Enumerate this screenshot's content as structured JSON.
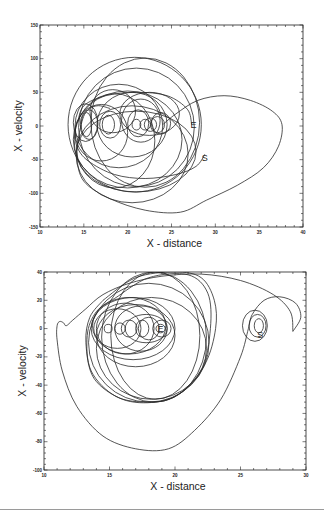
{
  "page": {
    "cropped_caption_fragment": "…a typical trajectory …"
  },
  "chart_data": [
    {
      "type": "line",
      "subtype": "phase-space trajectory",
      "title": "",
      "xlabel": "X - distance",
      "ylabel": "X - velocity",
      "xlim": [
        10,
        40
      ],
      "ylim": [
        -150,
        150
      ],
      "xticks": [
        10,
        15,
        20,
        25,
        30,
        35,
        40
      ],
      "yticks": [
        -150,
        -100,
        -50,
        0,
        50,
        100,
        150
      ],
      "xtick_labels": [
        "10",
        "15",
        "20",
        "25",
        "30",
        "35",
        "40"
      ],
      "ytick_labels": [
        "-150",
        "-100",
        "-50",
        "0",
        "50",
        "100",
        "150"
      ],
      "grid": false,
      "legend": null,
      "frame_px": {
        "x0": 40,
        "y0": 25,
        "x1": 303,
        "y1": 227
      },
      "annotations": [
        {
          "text": "E",
          "x": 27.5,
          "y": 2
        },
        {
          "text": "S",
          "x": 28.8,
          "y": -47
        }
      ],
      "loops": [
        {
          "cx": 15.3,
          "cy": 2,
          "rx": 0.6,
          "ry": 18
        },
        {
          "cx": 15.6,
          "cy": 2,
          "rx": 1.0,
          "ry": 22
        },
        {
          "cx": 15.2,
          "cy": 5,
          "rx": 1.4,
          "ry": 28
        },
        {
          "cx": 17.8,
          "cy": 2,
          "rx": 0.7,
          "ry": 14
        },
        {
          "cx": 18.0,
          "cy": 2,
          "rx": 1.2,
          "ry": 20
        },
        {
          "cx": 18.3,
          "cy": 22,
          "rx": 2.6,
          "ry": 32
        },
        {
          "cx": 21.0,
          "cy": 2,
          "rx": 0.5,
          "ry": 8
        },
        {
          "cx": 21.2,
          "cy": 4,
          "rx": 1.2,
          "ry": 20
        },
        {
          "cx": 21.5,
          "cy": 8,
          "rx": 2.2,
          "ry": 32
        },
        {
          "cx": 22.0,
          "cy": 2,
          "rx": 0.6,
          "ry": 8
        },
        {
          "cx": 22.6,
          "cy": 2,
          "rx": 0.7,
          "ry": 10
        },
        {
          "cx": 23.4,
          "cy": 2,
          "rx": 0.8,
          "ry": 12
        },
        {
          "cx": 23.8,
          "cy": 4,
          "rx": 1.1,
          "ry": 16
        },
        {
          "cx": 22.5,
          "cy": 18,
          "rx": 3.4,
          "ry": 32
        },
        {
          "cx": 20.5,
          "cy": 2,
          "rx": 4.0,
          "ry": 48
        },
        {
          "cx": 19.0,
          "cy": 0,
          "rx": 5.0,
          "ry": 62
        },
        {
          "cx": 21.0,
          "cy": -2,
          "rx": 6.6,
          "ry": 88
        },
        {
          "cx": 22.0,
          "cy": 5,
          "rx": 6.2,
          "ry": 96
        },
        {
          "cx": 20.8,
          "cy": 2,
          "rx": 7.6,
          "ry": 100
        },
        {
          "cx": 17.0,
          "cy": -10,
          "rx": 3.0,
          "ry": 42
        },
        {
          "cx": 18.5,
          "cy": -22,
          "rx": 4.6,
          "ry": 70
        },
        {
          "cx": 20.0,
          "cy": -20,
          "rx": 6.2,
          "ry": 72
        },
        {
          "cx": 20.5,
          "cy": -42,
          "rx": 6.4,
          "ry": 72
        },
        {
          "cx": 21.0,
          "cy": -38,
          "rx": 6.8,
          "ry": 60
        }
      ],
      "curves": [
        {
          "name": "escape-lobe",
          "points": [
            [
              24.0,
              2
            ],
            [
              25.5,
              18
            ],
            [
              28,
              38
            ],
            [
              31,
              45
            ],
            [
              34,
              38
            ],
            [
              36.5,
              22
            ],
            [
              37.6,
              2
            ],
            [
              37.2,
              -30
            ],
            [
              35.5,
              -62
            ],
            [
              32.5,
              -88
            ],
            [
              29,
              -110
            ],
            [
              26,
              -128
            ],
            [
              22,
              -125
            ],
            [
              18,
              -108
            ],
            [
              15,
              -82
            ],
            [
              14.2,
              -45
            ],
            [
              14.5,
              -10
            ],
            [
              15.2,
              20
            ],
            [
              16.5,
              30
            ],
            [
              18,
              26
            ]
          ]
        },
        {
          "name": "start-tail",
          "points": [
            [
              28.8,
              -42
            ],
            [
              27.8,
              -60
            ],
            [
              25.5,
              -72
            ],
            [
              22,
              -78
            ],
            [
              18.5,
              -72
            ],
            [
              15.5,
              -52
            ],
            [
              14.2,
              -30
            ],
            [
              14.0,
              -5
            ]
          ]
        },
        {
          "name": "arc-mid",
          "points": [
            [
              14.3,
              5
            ],
            [
              15.0,
              30
            ],
            [
              17.5,
              45
            ],
            [
              21,
              50
            ],
            [
              24.5,
              45
            ],
            [
              26.8,
              25
            ],
            [
              27.3,
              2
            ]
          ]
        }
      ]
    },
    {
      "type": "line",
      "subtype": "phase-space trajectory",
      "title": "",
      "xlabel": "X - distance",
      "ylabel": "X - velocity",
      "xlim": [
        10,
        30
      ],
      "ylim": [
        -100,
        40
      ],
      "xticks": [
        10,
        15,
        20,
        25,
        30
      ],
      "yticks": [
        -100,
        -80,
        -60,
        -40,
        -20,
        0,
        20,
        40
      ],
      "xtick_labels": [
        "10",
        "15",
        "20",
        "25",
        "30"
      ],
      "ytick_labels": [
        "-100",
        "-80",
        "-60",
        "-40",
        "-20",
        "0",
        "20",
        "40"
      ],
      "grid": false,
      "legend": null,
      "frame_px": {
        "x0": 44,
        "y0": 272,
        "x1": 306,
        "y1": 470
      },
      "annotations": [
        {
          "text": "E",
          "x": 18.9,
          "y": 0
        },
        {
          "text": "S",
          "x": 26.5,
          "y": -4
        }
      ],
      "loops": [
        {
          "cx": 14.9,
          "cy": 0,
          "rx": 0.3,
          "ry": 3
        },
        {
          "cx": 15.8,
          "cy": 0,
          "rx": 0.4,
          "ry": 4
        },
        {
          "cx": 16.5,
          "cy": 0,
          "rx": 0.6,
          "ry": 6
        },
        {
          "cx": 17.5,
          "cy": 0,
          "rx": 0.5,
          "ry": 6
        },
        {
          "cx": 18.0,
          "cy": 0,
          "rx": 0.8,
          "ry": 8
        },
        {
          "cx": 18.9,
          "cy": 0,
          "rx": 0.35,
          "ry": 3
        },
        {
          "cx": 19.0,
          "cy": 0,
          "rx": 0.7,
          "ry": 6
        },
        {
          "cx": 15.6,
          "cy": 0,
          "rx": 1.8,
          "ry": 14
        },
        {
          "cx": 16.2,
          "cy": 0,
          "rx": 2.2,
          "ry": 18
        },
        {
          "cx": 17.4,
          "cy": 0,
          "rx": 2.0,
          "ry": 16
        },
        {
          "cx": 17.8,
          "cy": 0,
          "rx": 1.6,
          "ry": 10
        },
        {
          "cx": 16.5,
          "cy": 2,
          "rx": 2.8,
          "ry": 20
        },
        {
          "cx": 16.8,
          "cy": 0,
          "rx": 3.2,
          "ry": 22
        },
        {
          "cx": 17.0,
          "cy": -5,
          "rx": 3.0,
          "ry": 22
        },
        {
          "cx": 18.2,
          "cy": -14,
          "rx": 4.2,
          "ry": 36
        },
        {
          "cx": 18.0,
          "cy": -10,
          "rx": 4.6,
          "ry": 42
        },
        {
          "cx": 18.4,
          "cy": -6,
          "rx": 4.0,
          "ry": 46
        },
        {
          "cx": 18.5,
          "cy": -5,
          "rx": 3.4,
          "ry": 45
        },
        {
          "cx": 26.4,
          "cy": 2,
          "rx": 0.35,
          "ry": 5
        },
        {
          "cx": 26.3,
          "cy": 2,
          "rx": 0.65,
          "ry": 8
        },
        {
          "cx": 26.1,
          "cy": 2,
          "rx": 0.95,
          "ry": 11
        }
      ],
      "curves": [
        {
          "name": "outer-spiral",
          "points": [
            [
              29.0,
              -2
            ],
            [
              29.6,
              8
            ],
            [
              29.2,
              18
            ],
            [
              28.0,
              22.5
            ],
            [
              26.8,
              20
            ],
            [
              25.9,
              10
            ],
            [
              25.6,
              0
            ],
            [
              25.0,
              -20
            ],
            [
              23.5,
              -50
            ],
            [
              21.5,
              -72
            ],
            [
              19.5,
              -85
            ],
            [
              17,
              -85
            ],
            [
              14.5,
              -76
            ],
            [
              12.5,
              -55
            ],
            [
              11.4,
              -30
            ],
            [
              11.0,
              -8
            ],
            [
              11.0,
              2
            ],
            [
              11.2,
              5
            ],
            [
              11.5,
              4
            ],
            [
              11.7,
              2
            ],
            [
              12.2,
              6
            ],
            [
              13.2,
              14
            ],
            [
              14.5,
              24
            ],
            [
              16.5,
              32
            ],
            [
              19,
              37
            ],
            [
              22,
              38.5
            ],
            [
              25,
              34
            ],
            [
              27.5,
              24
            ],
            [
              28.8,
              12
            ],
            [
              29.0,
              -2
            ]
          ]
        },
        {
          "name": "big-loop",
          "points": [
            [
              14.5,
              20
            ],
            [
              17,
              36
            ],
            [
              20,
              40
            ],
            [
              22,
              36
            ],
            [
              23.0,
              20
            ],
            [
              23.1,
              0
            ],
            [
              22.3,
              -25
            ],
            [
              20.5,
              -45
            ],
            [
              18.5,
              -52
            ],
            [
              16,
              -50
            ],
            [
              13.8,
              -35
            ],
            [
              13.2,
              -10
            ],
            [
              13.5,
              8
            ],
            [
              14.5,
              20
            ]
          ]
        },
        {
          "name": "big-loop-2",
          "points": [
            [
              15.5,
              22
            ],
            [
              18,
              36
            ],
            [
              21,
              38
            ],
            [
              22.5,
              25
            ],
            [
              22.7,
              0
            ],
            [
              22,
              -30
            ],
            [
              20,
              -48
            ],
            [
              18,
              -52
            ],
            [
              15.5,
              -48
            ],
            [
              13.6,
              -30
            ],
            [
              13.3,
              -5
            ],
            [
              14,
              12
            ],
            [
              15.5,
              22
            ]
          ]
        }
      ]
    }
  ]
}
